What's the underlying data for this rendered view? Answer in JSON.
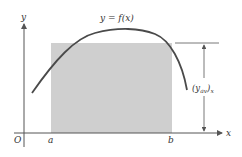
{
  "diagram": {
    "colors": {
      "axis": "#555555",
      "curve": "#4a4a4a",
      "rectangle_fill": "#cfcfcf",
      "arrow": "#555555",
      "text": "#333333"
    },
    "labels": {
      "y_axis": "y",
      "x_axis": "x",
      "origin": "O",
      "a": "a",
      "b": "b",
      "curve": "y = f(x)",
      "average_height": "(y",
      "average_height_sub": "av",
      "average_height_close": ")",
      "average_height_subx": "x"
    }
  }
}
